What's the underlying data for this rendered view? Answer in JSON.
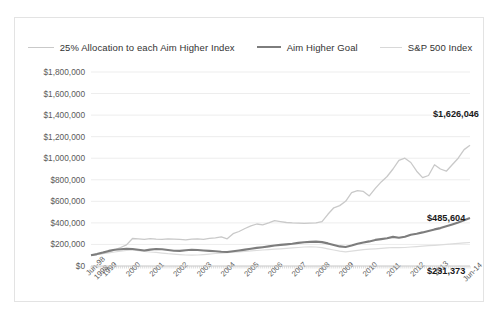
{
  "legend": {
    "items": [
      {
        "label": "25% Allocation to each Aim Higher Index",
        "color": "#c9c9c9",
        "key": "alloc25"
      },
      {
        "label": "Aim Higher Goal",
        "color": "#7d7d7d",
        "key": "goal"
      },
      {
        "label": "S&P 500 Index",
        "color": "#dcdcdc",
        "key": "sp500"
      }
    ]
  },
  "chart_data": {
    "type": "line",
    "title": "",
    "xlabel": "",
    "ylabel": "",
    "grid": true,
    "legend_position": "top",
    "ylim": [
      0,
      1800000
    ],
    "ytick_labels": [
      "$1,800,000",
      "$1,600,000",
      "$1,400,000",
      "$1,200,000",
      "$1,000,000",
      "$800,000",
      "$600,000",
      "$400,000",
      "$200,000",
      "$0"
    ],
    "ytick_values": [
      1800000,
      1600000,
      1400000,
      1200000,
      1000000,
      800000,
      600000,
      400000,
      200000,
      0
    ],
    "xtick_labels": [
      "Jun-98",
      "1998",
      "1999",
      "2000",
      "2001",
      "2002",
      "2003",
      "2004",
      "2005",
      "2006",
      "2007",
      "2008",
      "2009",
      "2010",
      "2011",
      "2012",
      "2013",
      "Jun-14"
    ],
    "x_start": "Jun-98",
    "x_end": "Jun-14",
    "annotations": [
      {
        "text": "$1,626,046",
        "series": "alloc25",
        "value": 1626046
      },
      {
        "text": "$485,604",
        "series": "goal",
        "value": 485604
      },
      {
        "text": "$231,373",
        "series": "sp500",
        "value": 231373
      }
    ],
    "x": [
      1998.45,
      1998.7,
      1998.95,
      1999.2,
      1999.45,
      1999.7,
      1999.95,
      2000.2,
      2000.45,
      2000.7,
      2000.95,
      2001.2,
      2001.45,
      2001.7,
      2001.95,
      2002.2,
      2002.45,
      2002.7,
      2002.95,
      2003.2,
      2003.45,
      2003.7,
      2003.95,
      2004.2,
      2004.45,
      2004.7,
      2004.95,
      2005.2,
      2005.45,
      2005.7,
      2005.95,
      2006.2,
      2006.45,
      2006.7,
      2006.95,
      2007.2,
      2007.45,
      2007.7,
      2007.95,
      2008.2,
      2008.45,
      2008.7,
      2008.95,
      2009.2,
      2009.45,
      2009.7,
      2009.95,
      2010.2,
      2010.45,
      2010.7,
      2010.95,
      2011.2,
      2011.45,
      2011.7,
      2011.95,
      2012.2,
      2012.45,
      2012.7,
      2012.95,
      2013.2,
      2013.45,
      2013.7,
      2013.95,
      2014.2,
      2014.45
    ],
    "series": [
      {
        "name": "25% Allocation to each Aim Higher Index",
        "key": "alloc25",
        "color": "#c9c9c9",
        "values": [
          100000,
          108000,
          118000,
          132000,
          150000,
          172000,
          196000,
          255000,
          252000,
          248000,
          254000,
          250000,
          247000,
          252000,
          250000,
          247000,
          243000,
          249000,
          252000,
          248000,
          256000,
          262000,
          270000,
          252000,
          300000,
          320000,
          348000,
          372000,
          390000,
          382000,
          400000,
          420000,
          412000,
          404000,
          400000,
          398000,
          396000,
          398000,
          400000,
          412000,
          480000,
          540000,
          560000,
          600000,
          680000,
          700000,
          692000,
          650000,
          720000,
          780000,
          830000,
          900000,
          980000,
          1000000,
          960000,
          880000,
          820000,
          840000,
          940000,
          900000,
          880000,
          940000,
          1000000,
          1080000,
          1120000
        ]
      },
      {
        "name": "Aim Higher Goal",
        "key": "goal",
        "color": "#7d7d7d",
        "values": [
          100000,
          110000,
          124000,
          140000,
          150000,
          156000,
          160000,
          158000,
          150000,
          144000,
          152000,
          158000,
          155000,
          148000,
          142000,
          140000,
          146000,
          150000,
          148000,
          144000,
          140000,
          136000,
          132000,
          130000,
          136000,
          144000,
          152000,
          160000,
          168000,
          174000,
          182000,
          190000,
          196000,
          200000,
          206000,
          214000,
          220000,
          224000,
          226000,
          222000,
          210000,
          196000,
          182000,
          176000,
          190000,
          206000,
          218000,
          228000,
          242000,
          250000,
          258000,
          270000,
          262000,
          272000,
          290000,
          300000,
          312000,
          326000,
          340000,
          352000,
          368000,
          386000,
          404000,
          424000,
          444000
        ]
      },
      {
        "name": "S&P 500 Index",
        "key": "sp500",
        "color": "#dcdcdc",
        "values": [
          100000,
          106000,
          114000,
          122000,
          130000,
          138000,
          146000,
          148000,
          142000,
          136000,
          130000,
          126000,
          120000,
          114000,
          110000,
          106000,
          102000,
          100000,
          102000,
          106000,
          110000,
          116000,
          120000,
          124000,
          128000,
          132000,
          136000,
          140000,
          144000,
          148000,
          152000,
          156000,
          160000,
          164000,
          168000,
          172000,
          176000,
          178000,
          176000,
          170000,
          160000,
          148000,
          138000,
          132000,
          138000,
          146000,
          152000,
          156000,
          160000,
          164000,
          168000,
          172000,
          170000,
          172000,
          176000,
          180000,
          184000,
          188000,
          192000,
          196000,
          200000,
          206000,
          210000,
          214000,
          218000
        ]
      }
    ]
  }
}
